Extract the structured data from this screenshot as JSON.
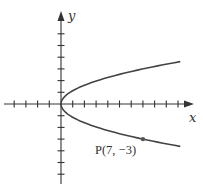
{
  "chart_data": {
    "type": "line",
    "title": "",
    "xlabel": "x",
    "ylabel": "y",
    "equation": "x = (7/9) y^2",
    "series": [
      {
        "name": "parabola",
        "description": "Parabola opening to the right with vertex at origin, passing through P(7, -3)",
        "points": [
          {
            "x": 10.2,
            "y": 3.62
          },
          {
            "x": 7,
            "y": 3
          },
          {
            "x": 3.11,
            "y": 2
          },
          {
            "x": 0.78,
            "y": 1
          },
          {
            "x": 0,
            "y": 0
          },
          {
            "x": 0.78,
            "y": -1
          },
          {
            "x": 3.11,
            "y": -2
          },
          {
            "x": 7,
            "y": -3
          },
          {
            "x": 10.2,
            "y": -3.62
          }
        ]
      }
    ],
    "annotations": [
      {
        "label": "P(7, −3)",
        "x": 7,
        "y": -3,
        "marker": "dot"
      }
    ],
    "xlim": [
      -4,
      11
    ],
    "ylim": [
      -6,
      7
    ],
    "x_ticks_left": 4,
    "x_ticks_right": 10,
    "y_ticks_up": 6,
    "y_ticks_down": 6,
    "grid": false,
    "tick_labels": false,
    "colors": {
      "axis": "#333333",
      "curve": "#444444",
      "point": "#555555"
    }
  },
  "labels": {
    "x_axis": "x",
    "y_axis": "y",
    "point": "P(7, −3)"
  }
}
